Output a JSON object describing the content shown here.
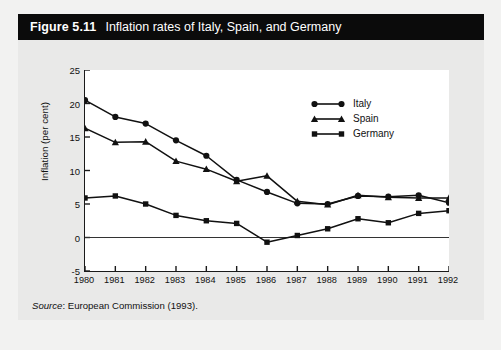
{
  "figure": {
    "number": "Figure 5.11",
    "title": "Inflation rates of Italy, Spain, and Germany",
    "source_label": "Source",
    "source_text": ": European Commission (1993)."
  },
  "legend": {
    "position": "top-right",
    "items": [
      {
        "label": "Italy",
        "marker": "circle",
        "color": "#111111"
      },
      {
        "label": "Spain",
        "marker": "triangle",
        "color": "#111111"
      },
      {
        "label": "Germany",
        "marker": "square",
        "color": "#111111"
      }
    ]
  },
  "chart_data": {
    "type": "line",
    "title": "Inflation rates of Italy, Spain, and Germany",
    "xlabel": "",
    "ylabel": "Inflation (per cent)",
    "x": [
      1980,
      1981,
      1982,
      1983,
      1984,
      1985,
      1986,
      1987,
      1988,
      1989,
      1990,
      1991,
      1992
    ],
    "categories": [
      "1980",
      "1981",
      "1982",
      "1983",
      "1984",
      "1985",
      "1986",
      "1987",
      "1988",
      "1989",
      "1990",
      "1991",
      "1992"
    ],
    "xlim": [
      1980,
      1992
    ],
    "ylim": [
      -5,
      25
    ],
    "yticks": [
      -5,
      0,
      5,
      10,
      15,
      20,
      25
    ],
    "ytick_labels": [
      "-5",
      "0",
      "5",
      "10",
      "15",
      "20",
      "25"
    ],
    "grid": false,
    "zero_line": true,
    "series": [
      {
        "name": "Italy",
        "marker": "circle",
        "color": "#111111",
        "values": [
          20.5,
          18.0,
          17.0,
          14.5,
          12.2,
          8.6,
          6.8,
          5.1,
          5.0,
          6.2,
          6.1,
          6.3,
          5.2
        ]
      },
      {
        "name": "Spain",
        "marker": "triangle",
        "color": "#111111",
        "values": [
          16.3,
          14.2,
          14.3,
          11.4,
          10.2,
          8.4,
          9.2,
          5.4,
          4.9,
          6.3,
          6.0,
          5.9,
          5.9
        ]
      },
      {
        "name": "Germany",
        "marker": "square",
        "color": "#111111",
        "values": [
          5.9,
          6.2,
          5.0,
          3.3,
          2.5,
          2.1,
          -0.7,
          0.3,
          1.3,
          2.8,
          2.2,
          3.6,
          4.0
        ]
      }
    ]
  }
}
